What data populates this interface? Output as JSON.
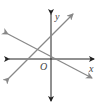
{
  "diagram": {
    "type": "coordinate-plane",
    "axes": {
      "x_label": "x",
      "y_label": "y",
      "origin_label": "O",
      "axis_color": "#222222"
    },
    "lines": [
      {
        "name": "line-positive-slope",
        "color": "#888888",
        "x1": 8,
        "y1": 79,
        "x2": 74,
        "y2": 13
      },
      {
        "name": "line-negative-slope",
        "color": "#888888",
        "x1": 7,
        "y1": 33,
        "x2": 93,
        "y2": 79
      }
    ]
  }
}
